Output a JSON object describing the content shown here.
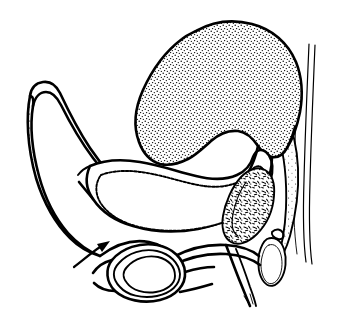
{
  "figure": {
    "title": "Sagittal section line drawing of lower abdomen and pelvis",
    "caption": "",
    "background_color": "#ffffff",
    "ink_color": "#000000",
    "style": "black-and-white stipple line art, no labels"
  },
  "annotations": {
    "arrow": {
      "name": "pointer-arrow",
      "direction": "up-and-to-the-right",
      "label": "",
      "tail_x": 76,
      "tail_y": 264,
      "tip_x": 107,
      "tip_y": 243
    }
  },
  "structures": [
    {
      "id": "gravid-uterus",
      "label": "",
      "fill": "stipple-dense",
      "outline_weight": "heavy",
      "position": "upper-center-right",
      "note": "Large ovoid stippled mass occupying upper portion of the field"
    },
    {
      "id": "abdominal-wall",
      "label": "",
      "fill": "stipple-sparse",
      "outline_weight": "heavy",
      "position": "left",
      "note": "Long tapering crescent along left margin"
    },
    {
      "id": "bladder",
      "label": "",
      "fill": "white",
      "outline_weight": "heavy",
      "position": "center",
      "note": "Curved sausage-shaped hollow viscus with crenated inner lining"
    },
    {
      "id": "rectum",
      "label": "",
      "fill": "speckle-coarse",
      "outline_weight": "medium",
      "position": "right-of-center",
      "note": "Elongated oblique structure with coarse speckled content"
    },
    {
      "id": "sacrum-spine",
      "label": "",
      "fill": "white",
      "outline_weight": "light",
      "position": "far-right",
      "note": "Vertical paired line bands at right edge"
    },
    {
      "id": "anal-canal",
      "label": "",
      "fill": "white",
      "outline_weight": "medium",
      "position": "lower-right",
      "note": "Small vertical oval ring"
    },
    {
      "id": "ring-structure",
      "label": "",
      "fill": "white",
      "outline_weight": "heavy",
      "position": "lower-left-center",
      "note": "Oval ring with thick speckled wall, indicated by the arrow"
    },
    {
      "id": "perineal-band",
      "label": "",
      "fill": "white",
      "outline_weight": "medium",
      "position": "bottom-center",
      "note": "Horizontal band connecting ring structure to pelvic floor"
    },
    {
      "id": "descending-limb",
      "label": "",
      "fill": "white",
      "outline_weight": "medium",
      "position": "bottom-right",
      "note": "Narrow tapering limb descending toward lower border"
    }
  ]
}
